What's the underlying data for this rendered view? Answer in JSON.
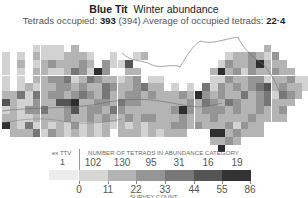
{
  "header": {
    "species": "Blue Tit",
    "season": "Winter abundance",
    "occupied_label": "Tetrads occupied:",
    "occupied_value": "393",
    "occupied_alt": "(394)",
    "average_label": "Average of occupied tetrads:",
    "average_value": "22·4"
  },
  "legend": {
    "extra_label": "ex TTV",
    "extra_value": "1",
    "category_label": "NUMBER OF TETRADS IN ABUNDANCE CATEGORY",
    "category_counts": [
      "102",
      "130",
      "95",
      "31",
      "16",
      "19"
    ],
    "scale_colors": [
      "#d6d6d6",
      "#b4b4b4",
      "#959595",
      "#777777",
      "#555555",
      "#333333"
    ],
    "tick_labels": [
      "0",
      "11",
      "22",
      "33",
      "44",
      "55",
      "86"
    ],
    "axis_label": "SURVEY COUNT"
  },
  "map": {
    "palette": {
      "0": "#e6e6e6",
      "1": "#d2d2d2",
      "2": "#b4b4b4",
      "3": "#959595",
      "4": "#777777",
      "5": "#555555",
      "6": "#2e2e2e"
    },
    "rows": [
      "..........................................",
      "....1111.2........................2.......",
      "1.1.21112221..1..12..........1223213......",
      "1.2.12322232.3115...........132236222.....",
      "1.1.2211243163..22.........26231322322....",
      "1.1.22334124322123.11......1132233122311..",
      "1.1212233232243223422.1.1.413232345232213.",
      "224142332343242233232223263232242341432...",
      "52113225562233243322222232432432234222....",
      "1213342235233243222222363233323223223.....",
      "2211222232232322323322232223222232222.....",
      "6214121213121212121222332322231322........",
      ".2224132121212.222121222...6623222........",
      "...........................2232..........",
      "............................6............."
    ]
  }
}
